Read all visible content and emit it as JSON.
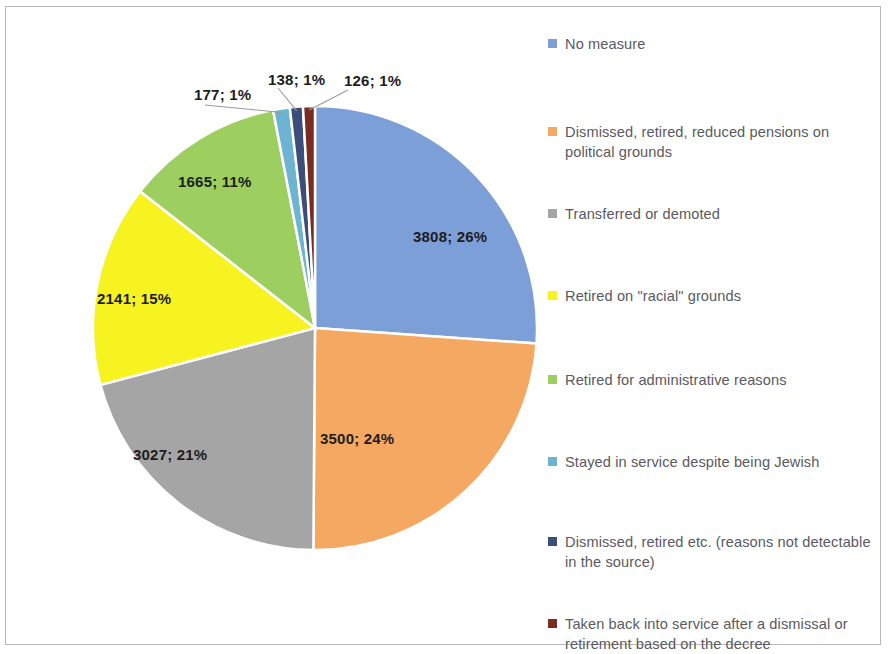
{
  "chart_data": {
    "type": "pie",
    "title": "",
    "total": 14582,
    "legend_position": "right",
    "start_angle_deg": 0,
    "direction": "clockwise",
    "categories": [
      "No measure",
      "Dismissed, retired, reduced pensions on political grounds",
      "Transferred or demoted",
      "Retired on \"racial\" grounds",
      "Retired for administrative reasons",
      "Stayed in service despite being Jewish",
      "Dismissed, retired etc. (reasons not detectable in the source)",
      "Taken back into service after a dismissal or retirement based on the decree"
    ],
    "values": [
      3808,
      3500,
      3027,
      2141,
      1665,
      177,
      138,
      126
    ],
    "percents": [
      26,
      24,
      21,
      15,
      11,
      1,
      1,
      1
    ],
    "data_labels": [
      "3808; 26%",
      "3500; 24%",
      "3027; 21%",
      "2141; 15%",
      "1665; 11%",
      "177; 1%",
      "138; 1%",
      "126; 1%"
    ],
    "colors": [
      "#7d9fd8",
      "#f5a862",
      "#a5a5a5",
      "#f7f321",
      "#9ccf5f",
      "#6cb4d2",
      "#3b4d78",
      "#7a2b22"
    ]
  },
  "legend": {
    "items": [
      {
        "label": "No measure",
        "color": "#7d9fd8"
      },
      {
        "label": "Dismissed, retired, reduced pensions on political grounds",
        "color": "#f5a862"
      },
      {
        "label": "Transferred or demoted",
        "color": "#a5a5a5"
      },
      {
        "label": "Retired on \"racial\" grounds",
        "color": "#f7f321"
      },
      {
        "label": "Retired for administrative reasons",
        "color": "#9ccf5f"
      },
      {
        "label": "Stayed in service despite being Jewish",
        "color": "#6cb4d2"
      },
      {
        "label": "Dismissed, retired etc. (reasons not detectable in the source)",
        "color": "#3b4d78"
      },
      {
        "label": "Taken back into service after a dismissal or retirement based on the decree",
        "color": "#7a2b22"
      }
    ]
  },
  "labels_on_pie": [
    {
      "text": "3808; 26%",
      "x": 413,
      "y": 228
    },
    {
      "text": "3500; 24%",
      "x": 320,
      "y": 430
    },
    {
      "text": "3027; 21%",
      "x": 133,
      "y": 446
    },
    {
      "text": "2141; 15%",
      "x": 97,
      "y": 290
    },
    {
      "text": "1665; 11%",
      "x": 178,
      "y": 173
    },
    {
      "text": "177; 1%",
      "x": 194,
      "y": 86
    },
    {
      "text": "138; 1%",
      "x": 268,
      "y": 71
    },
    {
      "text": "126; 1%",
      "x": 344,
      "y": 72
    }
  ]
}
